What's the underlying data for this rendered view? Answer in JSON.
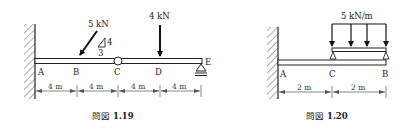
{
  "figures": [
    {
      "id": "fig-1-19",
      "caption_prefix": "問図",
      "caption_number": "1.19",
      "points": [
        "A",
        "B",
        "C",
        "D",
        "E"
      ],
      "dimensions": [
        "4 m",
        "4 m",
        "4 m",
        "4 m"
      ],
      "loads": {
        "inclined": {
          "label": "5 kN",
          "slope_rise": "4",
          "slope_run": "3"
        },
        "vertical": {
          "label": "4 kN"
        }
      },
      "supports": {
        "A": "fixed wall",
        "C": "hinge",
        "E": "roller"
      }
    },
    {
      "id": "fig-1-20",
      "caption_prefix": "問図",
      "caption_number": "1.20",
      "points": [
        "A",
        "C",
        "B"
      ],
      "dimensions": [
        "2 m",
        "2 m"
      ],
      "loads": {
        "distributed": {
          "label": "5 kN/m"
        }
      },
      "supports": {
        "A": "fixed wall",
        "C": "pin (upper beam)",
        "B": "pin (upper beam)"
      }
    }
  ]
}
